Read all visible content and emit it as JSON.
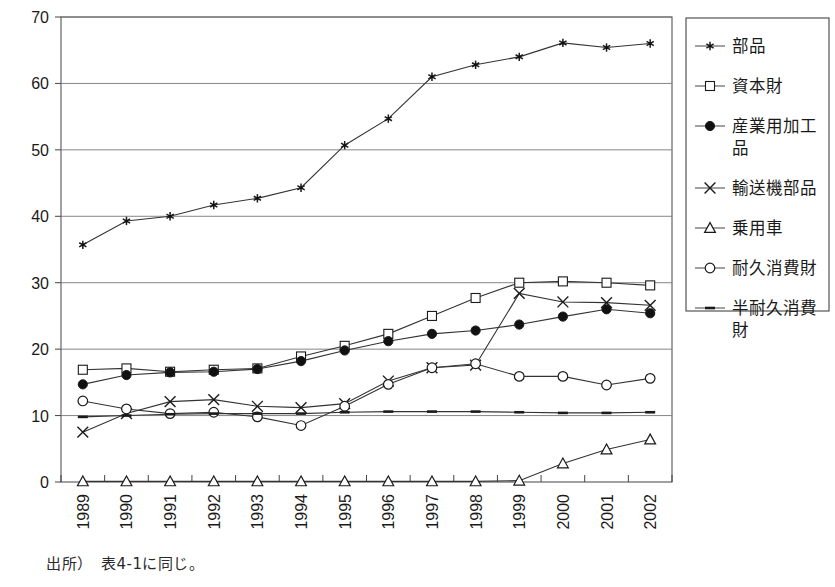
{
  "caption": "出所）　表4-1に同じ。",
  "legend": {
    "position": "right",
    "entries": [
      {
        "label": "部品",
        "marker": "star",
        "filled": true
      },
      {
        "label": "資本財",
        "marker": "square",
        "filled": false
      },
      {
        "label": "産業用加工品",
        "marker": "circle",
        "filled": true
      },
      {
        "label": "輸送機部品",
        "marker": "cross",
        "filled": false
      },
      {
        "label": "乗用車",
        "marker": "triangle",
        "filled": false
      },
      {
        "label": "耐久消費財",
        "marker": "circle",
        "filled": false
      },
      {
        "label": "半耐久消費財",
        "marker": "dash",
        "filled": false
      }
    ]
  },
  "chart_data": {
    "type": "line",
    "title": "",
    "xlabel": "",
    "ylabel": "",
    "ylim": [
      0,
      70
    ],
    "yticks": [
      0,
      10,
      20,
      30,
      40,
      50,
      60,
      70
    ],
    "grid": true,
    "legend_position": "right",
    "categories": [
      "1989",
      "1990",
      "1991",
      "1992",
      "1993",
      "1994",
      "1995",
      "1996",
      "1997",
      "1998",
      "1999",
      "2000",
      "2001",
      "2002"
    ],
    "series": [
      {
        "name": "部品",
        "marker": "star",
        "values": [
          35.7,
          39.3,
          40.0,
          41.7,
          42.7,
          44.3,
          50.7,
          54.7,
          61.0,
          62.8,
          64.0,
          66.1,
          65.4,
          66.0
        ]
      },
      {
        "name": "資本財",
        "marker": "square",
        "values": [
          16.9,
          17.1,
          16.6,
          16.9,
          17.1,
          18.9,
          20.5,
          22.3,
          25.0,
          27.7,
          30.0,
          30.2,
          30.0,
          29.6
        ]
      },
      {
        "name": "産業用加工品",
        "marker": "circle-filled",
        "values": [
          14.7,
          16.1,
          16.5,
          16.6,
          17.0,
          18.2,
          19.8,
          21.2,
          22.3,
          22.8,
          23.7,
          24.9,
          26.0,
          25.4
        ]
      },
      {
        "name": "輸送機部品",
        "marker": "cross",
        "values": [
          7.5,
          10.3,
          12.1,
          12.4,
          11.4,
          11.2,
          11.8,
          15.2,
          17.2,
          17.6,
          28.4,
          27.1,
          27.0,
          26.6
        ]
      },
      {
        "name": "乗用車",
        "marker": "triangle",
        "values": [
          0.1,
          0.1,
          0.1,
          0.1,
          0.1,
          0.1,
          0.1,
          0.1,
          0.1,
          0.1,
          0.2,
          2.8,
          4.9,
          6.4
        ]
      },
      {
        "name": "耐久消費財",
        "marker": "circle-open",
        "values": [
          12.2,
          11.0,
          10.3,
          10.5,
          9.8,
          8.5,
          11.4,
          14.7,
          17.2,
          17.8,
          15.9,
          15.9,
          14.6,
          15.6
        ]
      },
      {
        "name": "半耐久消費財",
        "marker": "dash",
        "values": [
          9.8,
          10.0,
          10.2,
          10.3,
          10.3,
          10.3,
          10.5,
          10.6,
          10.6,
          10.6,
          10.5,
          10.4,
          10.4,
          10.5
        ]
      }
    ]
  }
}
